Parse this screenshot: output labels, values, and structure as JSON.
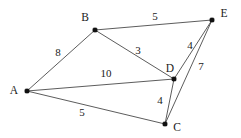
{
  "figure": {
    "type": "undirected-weighted-graph",
    "background_color": "#ffffff",
    "edge_color": "#4a4a4a",
    "node_color": "#111111",
    "text_color": "#1a1a1a",
    "width": 241,
    "height": 138
  },
  "nodes": [
    {
      "id": "A",
      "label": "A",
      "x": 27,
      "y": 91,
      "label_x": 14,
      "label_y": 90
    },
    {
      "id": "B",
      "label": "B",
      "x": 95,
      "y": 30,
      "label_x": 85,
      "label_y": 17
    },
    {
      "id": "C",
      "label": "C",
      "x": 165,
      "y": 124,
      "label_x": 177,
      "label_y": 127
    },
    {
      "id": "D",
      "label": "D",
      "x": 174,
      "y": 79,
      "label_x": 170,
      "label_y": 68
    },
    {
      "id": "E",
      "label": "E",
      "x": 212,
      "y": 20,
      "label_x": 224,
      "label_y": 13
    }
  ],
  "edges": [
    {
      "from": "A",
      "to": "B",
      "weight": "8",
      "label_x": 58,
      "label_y": 52
    },
    {
      "from": "A",
      "to": "D",
      "weight": "10",
      "label_x": 106,
      "label_y": 73
    },
    {
      "from": "A",
      "to": "C",
      "weight": "5",
      "label_x": 82,
      "label_y": 112
    },
    {
      "from": "B",
      "to": "E",
      "weight": "5",
      "label_x": 155,
      "label_y": 16
    },
    {
      "from": "B",
      "to": "D",
      "weight": "3",
      "label_x": 138,
      "label_y": 50
    },
    {
      "from": "D",
      "to": "E",
      "weight": "4",
      "label_x": 190,
      "label_y": 45
    },
    {
      "from": "D",
      "to": "C",
      "weight": "4",
      "label_x": 160,
      "label_y": 100
    },
    {
      "from": "C",
      "to": "E",
      "weight": "7",
      "label_x": 201,
      "label_y": 66
    }
  ],
  "chart_data": {
    "type": "diagram",
    "title": "",
    "vertices": [
      "A",
      "B",
      "C",
      "D",
      "E"
    ],
    "edge_list": [
      [
        "A",
        "B",
        8
      ],
      [
        "A",
        "D",
        10
      ],
      [
        "A",
        "C",
        5
      ],
      [
        "B",
        "E",
        5
      ],
      [
        "B",
        "D",
        3
      ],
      [
        "D",
        "E",
        4
      ],
      [
        "D",
        "C",
        4
      ],
      [
        "C",
        "E",
        7
      ]
    ]
  }
}
